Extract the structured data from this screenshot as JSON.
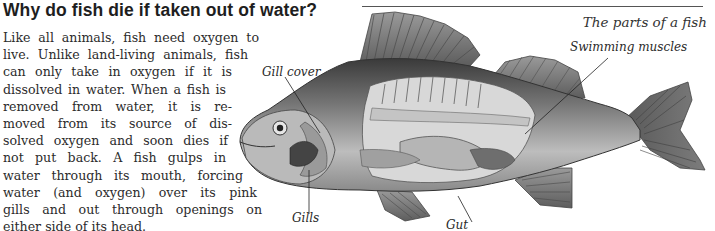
{
  "article": {
    "heading": "Why do fish die if taken out of water?",
    "body_lines": [
      "Like all animals, fish need oxygen to",
      "live. Unlike land-living animals, fish",
      "can only take in oxygen if it is",
      "dissolved in water. When a fish is",
      "removed from water, it is re-",
      "moved from its source of dis-",
      "solved oxygen and soon dies if",
      "not put back. A fish gulps in",
      "water through its mouth, forcing",
      "water (and oxygen) over its pink",
      "gills and out through openings on",
      "either side of its head."
    ]
  },
  "figure": {
    "caption": "The parts of a fish",
    "labels": {
      "swimming_muscles": "Swimming muscles",
      "gill_cover": "Gill cover",
      "gills": "Gills",
      "gut": "Gut"
    }
  }
}
